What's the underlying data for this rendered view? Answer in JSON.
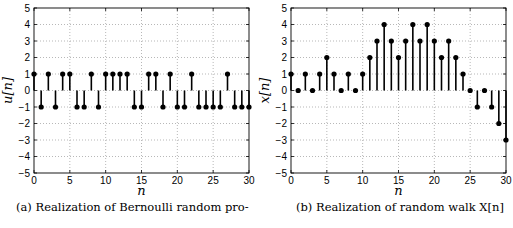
{
  "chart_data": [
    {
      "type": "stem",
      "title": "",
      "xlabel": "n",
      "ylabel": "u[n]",
      "xlim": [
        0,
        30
      ],
      "ylim": [
        -5,
        5
      ],
      "xticks": [
        0,
        5,
        10,
        15,
        20,
        25,
        30
      ],
      "yticks": [
        -5,
        -4,
        -3,
        -2,
        -1,
        0,
        1,
        2,
        3,
        4,
        5
      ],
      "grid": true,
      "x": [
        0,
        1,
        2,
        3,
        4,
        5,
        6,
        7,
        8,
        9,
        10,
        11,
        12,
        13,
        14,
        15,
        16,
        17,
        18,
        19,
        20,
        21,
        22,
        23,
        24,
        25,
        26,
        27,
        28,
        29,
        30
      ],
      "values": [
        1,
        -1,
        1,
        -1,
        1,
        1,
        -1,
        -1,
        1,
        -1,
        1,
        1,
        1,
        1,
        -1,
        -1,
        1,
        1,
        -1,
        1,
        -1,
        -1,
        1,
        -1,
        -1,
        -1,
        -1,
        1,
        -1,
        -1,
        -1
      ],
      "caption": "(a) Realization of Bernoulli random pro-"
    },
    {
      "type": "stem",
      "title": "",
      "xlabel": "n",
      "ylabel": "x[n]",
      "xlim": [
        0,
        30
      ],
      "ylim": [
        -5,
        5
      ],
      "xticks": [
        0,
        5,
        10,
        15,
        20,
        25,
        30
      ],
      "yticks": [
        -5,
        -4,
        -3,
        -2,
        -1,
        0,
        1,
        2,
        3,
        4,
        5
      ],
      "grid": true,
      "x": [
        0,
        1,
        2,
        3,
        4,
        5,
        6,
        7,
        8,
        9,
        10,
        11,
        12,
        13,
        14,
        15,
        16,
        17,
        18,
        19,
        20,
        21,
        22,
        23,
        24,
        25,
        26,
        27,
        28,
        29,
        30
      ],
      "values": [
        1,
        0,
        1,
        0,
        1,
        2,
        1,
        0,
        1,
        0,
        1,
        2,
        3,
        4,
        3,
        2,
        3,
        4,
        3,
        4,
        3,
        2,
        3,
        2,
        1,
        0,
        -1,
        0,
        -1,
        -2,
        -3
      ],
      "caption": "(b) Realization of random walk X[n]"
    }
  ]
}
